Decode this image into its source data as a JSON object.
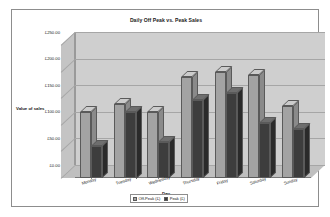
{
  "chart_data": {
    "type": "bar",
    "title": "Daily Off Peak vs. Peak Sales",
    "xlabel": "Day",
    "ylabel": "Value of sales",
    "categories": [
      "Monday",
      "Tuesday",
      "Wednesday",
      "Thursday",
      "Friday",
      "Saturday",
      "Sunday"
    ],
    "series": [
      {
        "name": "Off-Peak (£)",
        "color": "#a3a3a3",
        "values": [
          125,
          140,
          125,
          190,
          200,
          193,
          135
        ]
      },
      {
        "name": "Peak (£)",
        "color": "#3d3d3d",
        "values": [
          60,
          125,
          68,
          147,
          160,
          103,
          92
        ]
      }
    ],
    "ylim": [
      0,
      250
    ],
    "ytick_values": [
      250,
      200,
      150,
      100,
      50,
      0
    ],
    "ytick_labels": [
      "£250.00",
      "£200.00",
      "£150.00",
      "£100.00",
      "£50.00",
      "£0.00"
    ],
    "grid": true,
    "legend_position": "bottom",
    "style": "3d-column"
  },
  "colors": {
    "plot_back_wall": "#cfcfcf",
    "plot_side_wall": "#c4c4c4",
    "plot_floor": "#bfbfbf",
    "gridline": "#a6a6a6",
    "frame_border": "#8d8d8d",
    "page_background": "#ffffff"
  }
}
